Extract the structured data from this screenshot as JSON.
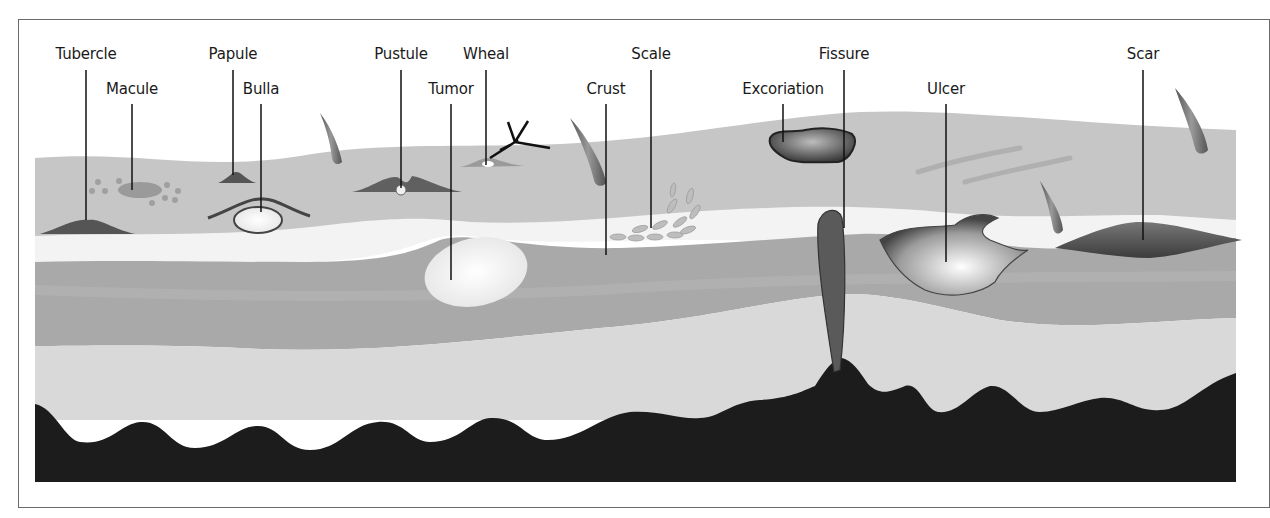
{
  "diagram": {
    "labels": {
      "tubercle": "Tubercle",
      "macule": "Macule",
      "papule": "Papule",
      "bulla": "Bulla",
      "pustule": "Pustule",
      "wheal": "Wheal",
      "tumor": "Tumor",
      "crust": "Crust",
      "scale": "Scale",
      "excoriation": "Excoriation",
      "fissure": "Fissure",
      "ulcer": "Ulcer",
      "scar": "Scar"
    },
    "layers": [
      "epidermis",
      "basement membrane",
      "dermis",
      "subcutaneous tissue",
      "deep tissue"
    ],
    "colors": {
      "epidermis": "#c4c4c4",
      "basement": "#f2f2f2",
      "dermis": "#a9a9a9",
      "subcutis": "#d9d9d9",
      "deep": "#1c1c1c",
      "frame": "#6a6a6a",
      "leader": "#111111"
    }
  }
}
